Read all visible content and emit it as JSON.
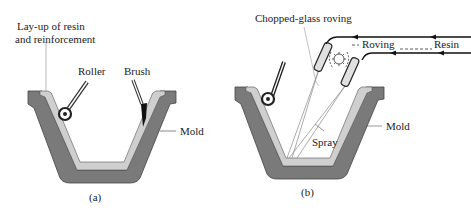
{
  "panel_a": {
    "caption": "(a)",
    "labels": {
      "layup_line1": "Lay-up of resin",
      "layup_line2": "and reinforcement",
      "roller": "Roller",
      "brush": "Brush",
      "mold": "Mold"
    }
  },
  "panel_b": {
    "caption": "(b)",
    "labels": {
      "chopped": "Chopped-glass roving",
      "roving": "Roving",
      "resin": "Resin",
      "spray": "Spray",
      "mold": "Mold"
    }
  },
  "colors": {
    "mold": "#7a7a7a",
    "layup": "#cfcfcf",
    "outline": "#333333"
  }
}
